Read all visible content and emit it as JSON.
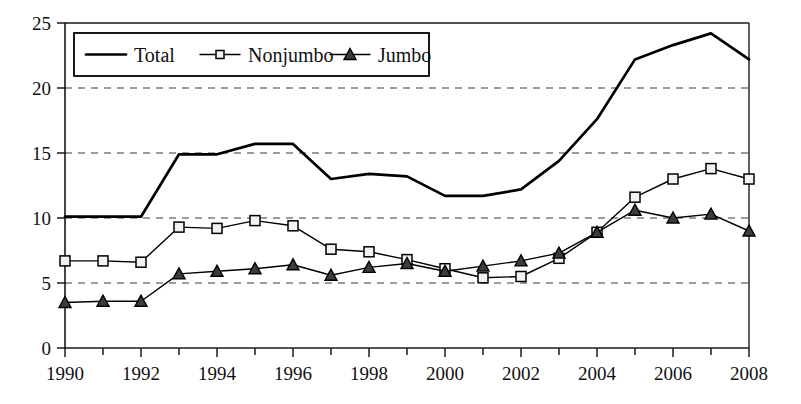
{
  "chart_data": {
    "type": "line",
    "title": "",
    "subtitle": "",
    "xlabel": "",
    "ylabel": "",
    "x": [
      1990,
      1991,
      1992,
      1993,
      1994,
      1995,
      1996,
      1997,
      1998,
      1999,
      2000,
      2001,
      2002,
      2003,
      2004,
      2005,
      2006,
      2007,
      2008
    ],
    "xlim": [
      1990,
      2008
    ],
    "ylim": [
      0,
      25
    ],
    "xtick_labels": [
      "1990",
      "1992",
      "1994",
      "1996",
      "1998",
      "2000",
      "2002",
      "2004",
      "2006",
      "2008"
    ],
    "xtick_values": [
      1990,
      1992,
      1994,
      1996,
      1998,
      2000,
      2002,
      2004,
      2006,
      2008
    ],
    "xtick_minor_values": [
      1991,
      1993,
      1995,
      1997,
      1999,
      2001,
      2003,
      2005,
      2007
    ],
    "ytick_labels": [
      "0",
      "5",
      "10",
      "15",
      "20",
      "25"
    ],
    "ytick_values": [
      0,
      5,
      10,
      15,
      20,
      25
    ],
    "grid": "horizontal-dashed",
    "gridline_values": [
      5,
      10,
      15,
      20
    ],
    "legend_position": "top-left-inside",
    "series": [
      {
        "name": "Total",
        "marker": "none",
        "color": "#000000",
        "values": [
          10.1,
          10.1,
          10.1,
          14.9,
          14.9,
          15.7,
          15.7,
          13.0,
          13.4,
          13.2,
          11.7,
          11.7,
          12.2,
          14.4,
          17.6,
          22.2,
          23.3,
          24.2,
          22.2
        ]
      },
      {
        "name": "Nonjumbo",
        "marker": "square",
        "color": "#000000",
        "values": [
          6.7,
          6.7,
          6.6,
          9.3,
          9.2,
          9.8,
          9.4,
          7.6,
          7.4,
          6.8,
          6.1,
          5.4,
          5.5,
          6.9,
          8.9,
          11.6,
          13.0,
          13.8,
          13.0
        ]
      },
      {
        "name": "Jumbo",
        "marker": "triangle",
        "color": "#3c3c3c",
        "values": [
          3.5,
          3.6,
          3.6,
          5.7,
          5.9,
          6.1,
          6.4,
          5.6,
          6.2,
          6.5,
          5.9,
          6.3,
          6.7,
          7.3,
          8.9,
          10.6,
          10.0,
          10.3,
          9.0
        ]
      }
    ],
    "legend": [
      {
        "label": "Total",
        "marker": "none"
      },
      {
        "label": "Nonjumbo",
        "marker": "square"
      },
      {
        "label": "Jumbo",
        "marker": "triangle"
      }
    ]
  }
}
